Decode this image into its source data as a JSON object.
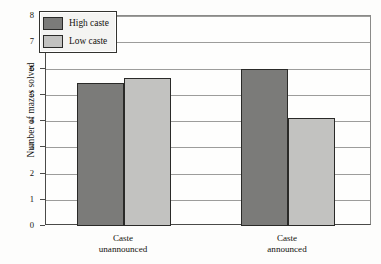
{
  "chart_data": {
    "type": "bar",
    "title": "",
    "subtitle": "",
    "xlabel": "",
    "ylabel": "Number of mazes solved",
    "ylim": [
      0,
      8
    ],
    "yticks": [
      0,
      1,
      2,
      3,
      4,
      5,
      6,
      7,
      8
    ],
    "ytick_labels": [
      "0",
      "1",
      "2",
      "3",
      "4",
      "5",
      "6",
      "7",
      "8"
    ],
    "grid": true,
    "grid_axis": "y",
    "legend_position": "top-left",
    "categories": [
      "Caste\nunannounced",
      "Caste\nannounced"
    ],
    "category_labels": [
      {
        "line1": "Caste",
        "line2": "unannounced"
      },
      {
        "line1": "Caste",
        "line2": "announced"
      }
    ],
    "series": [
      {
        "name": "High caste",
        "color": "#7b7b79",
        "values": [
          5.45,
          6.0
        ]
      },
      {
        "name": "Low caste",
        "color": "#c2c2c0",
        "values": [
          5.65,
          4.1
        ]
      }
    ],
    "annotations": []
  },
  "legend": {
    "items": [
      {
        "label": "High caste"
      },
      {
        "label": "Low caste"
      }
    ]
  },
  "axis": {
    "y_title": "Number of mazes solved"
  }
}
